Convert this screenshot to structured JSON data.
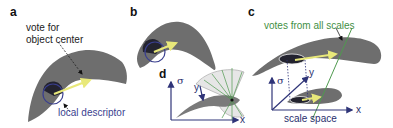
{
  "figure": {
    "panels": {
      "a": {
        "label": "a",
        "annotation_top": [
          "vote for",
          "object center"
        ],
        "annotation_bottom": "local descriptor"
      },
      "b": {
        "label": "b"
      },
      "c": {
        "label": "c",
        "annotation_top": "votes from all scales",
        "axis_sigma": "σ",
        "axis_y": "y",
        "axis_x": "x",
        "caption": "scale space"
      },
      "d": {
        "label": "d",
        "axis_sigma": "σ",
        "axis_y": "y",
        "axis_x": "x"
      }
    },
    "colors": {
      "shape_fill": "#6e6e6e",
      "descriptor_fill": "#2a2a3a",
      "vote_arrow": "#e8e87a",
      "axis": "#2f3478",
      "green_votes": "#4f9a4f",
      "blue_text": "#3a3f8f",
      "green_text": "#3f8f45"
    }
  }
}
